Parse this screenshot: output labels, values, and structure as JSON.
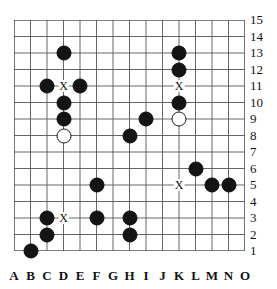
{
  "board": {
    "title": "Go board position diagram",
    "size": {
      "columns": 15,
      "rows": 15
    },
    "column_labels": [
      "A",
      "B",
      "C",
      "D",
      "E",
      "F",
      "G",
      "H",
      "I",
      "J",
      "K",
      "L",
      "M",
      "N",
      "O"
    ],
    "row_labels": [
      "15",
      "14",
      "13",
      "12",
      "11",
      "10",
      "9",
      "8",
      "7",
      "6",
      "5",
      "4",
      "3",
      "2",
      "1"
    ],
    "grid_color": "#555555",
    "black_color": "#141414",
    "white_color": "#ffffff",
    "marker_glyph": "X"
  },
  "chart_data": {
    "type": "scatter",
    "xlabel": "",
    "ylabel": "",
    "grid": true,
    "legend": false,
    "xlim": [
      1,
      15
    ],
    "ylim": [
      1,
      15
    ],
    "xtick_labels": [
      "A",
      "B",
      "C",
      "D",
      "E",
      "F",
      "G",
      "H",
      "I",
      "J",
      "K",
      "L",
      "M",
      "N",
      "O"
    ],
    "ytick_labels": [
      "1",
      "2",
      "3",
      "4",
      "5",
      "6",
      "7",
      "8",
      "9",
      "10",
      "11",
      "12",
      "13",
      "14",
      "15"
    ],
    "series": [
      {
        "name": "black-stones",
        "color": "#141414",
        "points": [
          {
            "col": "D",
            "row": 13
          },
          {
            "col": "K",
            "row": 13
          },
          {
            "col": "K",
            "row": 12
          },
          {
            "col": "C",
            "row": 11
          },
          {
            "col": "E",
            "row": 11
          },
          {
            "col": "D",
            "row": 10
          },
          {
            "col": "K",
            "row": 10
          },
          {
            "col": "D",
            "row": 9
          },
          {
            "col": "I",
            "row": 9
          },
          {
            "col": "H",
            "row": 8
          },
          {
            "col": "L",
            "row": 6
          },
          {
            "col": "F",
            "row": 5
          },
          {
            "col": "M",
            "row": 5
          },
          {
            "col": "N",
            "row": 5
          },
          {
            "col": "C",
            "row": 3
          },
          {
            "col": "F",
            "row": 3
          },
          {
            "col": "H",
            "row": 3
          },
          {
            "col": "C",
            "row": 2
          },
          {
            "col": "H",
            "row": 2
          },
          {
            "col": "B",
            "row": 1
          }
        ]
      },
      {
        "name": "white-stones",
        "color": "#ffffff",
        "points": [
          {
            "col": "D",
            "row": 8
          },
          {
            "col": "K",
            "row": 9
          }
        ]
      },
      {
        "name": "x-markers",
        "color": "#111111",
        "points": [
          {
            "col": "D",
            "row": 11,
            "label": "X"
          },
          {
            "col": "K",
            "row": 11,
            "label": "X"
          },
          {
            "col": "K",
            "row": 5,
            "label": "X"
          },
          {
            "col": "D",
            "row": 3,
            "label": "X"
          }
        ]
      }
    ]
  }
}
